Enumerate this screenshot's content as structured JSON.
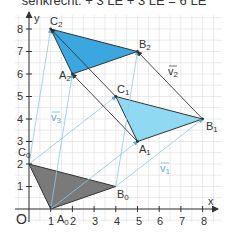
{
  "header": {
    "text": "senkrecht:  + 3 LE + 3 LE = 6 LE"
  },
  "axes": {
    "origin_label": "O",
    "x_label": "x",
    "y_label": "y",
    "x_ticks": [
      "1",
      "2",
      "3",
      "4",
      "5",
      "6",
      "7",
      "8"
    ],
    "y_ticks": [
      "1",
      "2",
      "3",
      "4",
      "5",
      "6",
      "7",
      "8"
    ]
  },
  "colors": {
    "grid": "#dcdcdc",
    "axis": "#333333",
    "triangle0_fill": "#7a7a7a",
    "triangle1_fill": "#8fd9f2",
    "triangle2_fill": "#3aa7e0",
    "shift_lines": "#8cc6ea",
    "vector_lines": "#333333"
  },
  "triangles": [
    {
      "name": "triangle-0",
      "points": {
        "A0": [
          1,
          0
        ],
        "B0": [
          4,
          1
        ],
        "C0": [
          0,
          2
        ]
      }
    },
    {
      "name": "triangle-1",
      "points": {
        "A1": [
          5,
          3
        ],
        "B1": [
          8,
          4
        ],
        "C1": [
          4,
          5
        ]
      }
    },
    {
      "name": "triangle-2",
      "points": {
        "A2": [
          2,
          6
        ],
        "B2": [
          5,
          7
        ],
        "C2": [
          1,
          8
        ]
      }
    }
  ],
  "labels": {
    "A0": "A",
    "A0_sub": "0",
    "B0": "B",
    "B0_sub": "0",
    "C0": "C",
    "C0_sub": "0",
    "A1": "A",
    "A1_sub": "1",
    "B1": "B",
    "B1_sub": "1",
    "C1": "C",
    "C1_sub": "1",
    "A2": "A",
    "A2_sub": "2",
    "B2": "B",
    "B2_sub": "2",
    "C2": "C",
    "C2_sub": "2",
    "v1": "v",
    "v1_sub": "1",
    "v2": "v",
    "v2_sub": "2",
    "v3": "v",
    "v3_sub": "3"
  },
  "vectors": {
    "v1": [
      4,
      3
    ],
    "v2": [
      -3,
      3
    ],
    "v3": [
      1,
      6
    ]
  }
}
